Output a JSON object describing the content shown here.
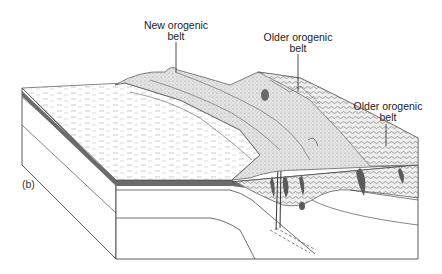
{
  "figure": {
    "panel_label": "(b)",
    "labels": [
      {
        "line1": "New orogenic",
        "line2": "belt"
      },
      {
        "line1": "Older orogenic",
        "line2": "belt"
      },
      {
        "line1": "Older orogenic",
        "line2": "belt"
      }
    ]
  },
  "colors": {
    "line": "#333333",
    "dark_layer": "#6b6b6b",
    "stipple": "#d9d9d9",
    "mountain_fill": "#e2e2e2",
    "intrusion": "#5a5a5a",
    "background": "#ffffff"
  }
}
